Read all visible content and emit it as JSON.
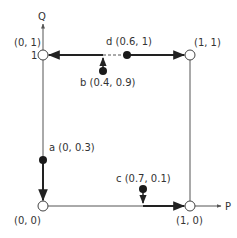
{
  "diagram": {
    "axes": {
      "x_label": "P",
      "y_label": "Q",
      "y_tick": "1"
    },
    "corners": [
      {
        "id": "origin",
        "label": "(0, 0)",
        "x": 0,
        "y": 0
      },
      {
        "id": "p1",
        "label": "(1, 0)",
        "x": 1,
        "y": 0
      },
      {
        "id": "q1",
        "label": "(0, 1)",
        "x": 0,
        "y": 1
      },
      {
        "id": "pq1",
        "label": "(1, 1)",
        "x": 1,
        "y": 1
      }
    ],
    "points": [
      {
        "id": "a",
        "label": "a (0, 0.3)",
        "x": 0,
        "y": 0.3,
        "moves_to": "(0, 0)"
      },
      {
        "id": "b",
        "label": "b (0.4, 0.9)",
        "x": 0.4,
        "y": 0.9,
        "moves_to": "(0, 1)"
      },
      {
        "id": "c",
        "label": "c (0.7, 0.1)",
        "x": 0.7,
        "y": 0.1,
        "moves_to": "(1, 0)"
      },
      {
        "id": "d",
        "label": "d (0.6, 1)",
        "x": 0.6,
        "y": 1,
        "moves_to": "(1, 1)"
      }
    ],
    "colors": {
      "line": "#555555",
      "thick": "#222222",
      "point_fill": "#1a1a1a",
      "open_fill": "#ffffff"
    }
  }
}
